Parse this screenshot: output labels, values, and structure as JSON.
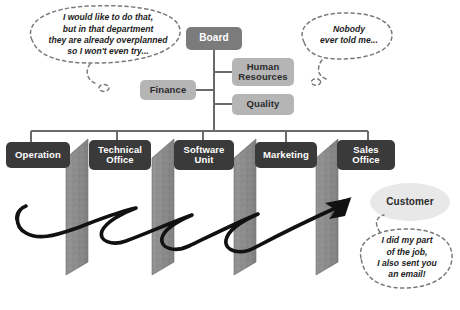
{
  "diagram": {
    "background_color": "#ffffff",
    "colors": {
      "box_dark": "#3a3a3a",
      "box_mid": "#7b7b7b",
      "box_light": "#b5b5b5",
      "oval_light": "#e8e8e8",
      "wall_gray": "#8c8c8c",
      "wall_gray_dark": "#6f6f6f",
      "connector_line": "#6a6a6a",
      "arrow_black": "#111111",
      "bubble_outline": "#7a7a7a",
      "text_light": "#ffffff",
      "text_dark": "#1d1d1d"
    }
  },
  "org": {
    "top": {
      "label": "Board"
    },
    "staff": [
      {
        "label": "Finance",
        "side": "left"
      },
      {
        "label": "Human\nResources",
        "side": "right"
      },
      {
        "label": "Quality",
        "side": "right"
      }
    ],
    "staff_labels": {
      "finance": "Finance",
      "human_resources_line1": "Human",
      "human_resources_line2": "Resources",
      "quality": "Quality"
    },
    "departments": [
      {
        "line1": "Operation",
        "line2": ""
      },
      {
        "line1": "Technical",
        "line2": "Office"
      },
      {
        "line1": "Software",
        "line2": "Unit"
      },
      {
        "line1": "Marketing",
        "line2": ""
      },
      {
        "line1": "Sales",
        "line2": "Office"
      }
    ],
    "customer": {
      "label": "Customer"
    },
    "walls": {
      "count": 4,
      "semantic": "silo-wall"
    }
  },
  "bubbles": [
    {
      "id": "bubble-overplanned",
      "lines": [
        "I would like to do that,",
        "but in that department",
        "they are already overplanned",
        "so I won't even try..."
      ]
    },
    {
      "id": "bubble-nobody-told-me",
      "lines": [
        "Nobody",
        "ever told me..."
      ]
    },
    {
      "id": "bubble-did-my-part",
      "lines": [
        "I did my part",
        "of the job,",
        "I also sent you",
        "an email!"
      ]
    }
  ]
}
